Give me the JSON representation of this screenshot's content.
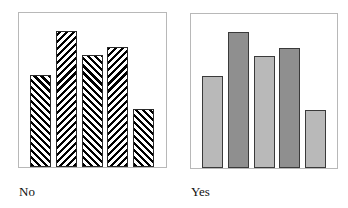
{
  "chart_data": [
    {
      "type": "bar",
      "title": "",
      "caption": "No",
      "categories": [
        "1",
        "2",
        "3",
        "4",
        "5"
      ],
      "values": [
        92,
        136,
        112,
        120,
        58
      ],
      "value_units": "relative (pixel height, no axis shown)",
      "fill": "hatched",
      "hatch_directions": [
        "back",
        "fwd",
        "back",
        "fwd",
        "back"
      ],
      "xlabel": "",
      "ylabel": "",
      "grid": false,
      "legend": null
    },
    {
      "type": "bar",
      "title": "",
      "caption": "Yes",
      "categories": [
        "1",
        "2",
        "3",
        "4",
        "5"
      ],
      "values": [
        92,
        136,
        112,
        120,
        58
      ],
      "value_units": "relative (pixel height, no axis shown)",
      "fill": "solid",
      "colors": [
        "#b9b9b9",
        "#8f8f8f",
        "#b9b9b9",
        "#8f8f8f",
        "#b9b9b9"
      ],
      "xlabel": "",
      "ylabel": "",
      "grid": false,
      "legend": null
    }
  ],
  "panels": {
    "left": {
      "caption": "No"
    },
    "right": {
      "caption": "Yes"
    }
  }
}
